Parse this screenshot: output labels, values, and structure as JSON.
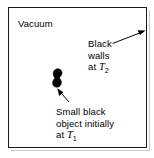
{
  "figure": {
    "background_color": "#ffffff",
    "line_color": "#1a1a1a"
  },
  "labels": {
    "vacuum": "Vacuum",
    "walls_line1": "Black",
    "walls_line2": "walls",
    "walls_line3_prefix": "at ",
    "walls_symbol": "T",
    "walls_subscript": "2",
    "object_line1": "Small black",
    "object_line2": "object initially",
    "object_line3_prefix": "at ",
    "object_symbol": "T",
    "object_subscript": "1"
  },
  "shapes": {
    "cavity_box": "rectangle-enclosure",
    "black_object": "irregular-blob",
    "arrow_to_wall": "arrow-up-right",
    "arrow_to_object": "arrow-up-left"
  }
}
